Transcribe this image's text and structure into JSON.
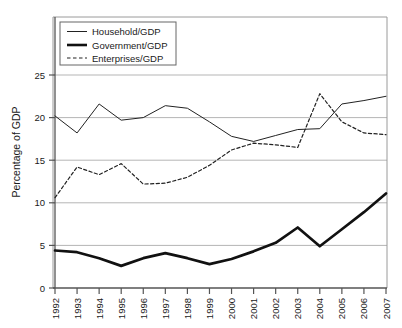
{
  "chart_data": {
    "type": "line",
    "title": "",
    "xlabel": "",
    "ylabel": "Percentage of GDP",
    "x": [
      "1992",
      "1993",
      "1994",
      "1995",
      "1996",
      "1997",
      "1998",
      "1999",
      "2000",
      "2001",
      "2002",
      "2003",
      "2004",
      "2005",
      "2006",
      "2007"
    ],
    "xtick_labels": [
      "1992",
      "1993",
      "1994",
      "1995",
      "1996",
      "1997",
      "1998",
      "1999",
      "2000",
      "2001",
      "2002",
      "2003",
      "2004",
      "2005",
      "2006",
      "2007"
    ],
    "ytick_labels": [
      "0",
      "5",
      "10",
      "15",
      "20",
      "25"
    ],
    "yticks": [
      0,
      5,
      10,
      15,
      20,
      25
    ],
    "ylim": [
      0,
      28.5
    ],
    "grid": "horizontal",
    "legend_position": "upper-left",
    "series": [
      {
        "name": "Household/GDP",
        "style": "solid-thin",
        "color": "#222222",
        "values": [
          20.2,
          18.2,
          21.6,
          19.7,
          20.0,
          21.4,
          21.1,
          19.5,
          17.8,
          17.2,
          17.9,
          18.6,
          18.7,
          21.6,
          22.0,
          22.5
        ]
      },
      {
        "name": "Government/GDP",
        "style": "solid-thick",
        "color": "#111111",
        "values": [
          4.4,
          4.2,
          3.5,
          2.6,
          3.5,
          4.1,
          3.5,
          2.8,
          3.4,
          4.3,
          5.3,
          7.1,
          4.9,
          6.9,
          8.9,
          11.1
        ]
      },
      {
        "name": "Enterprises/GDP",
        "style": "dashed",
        "color": "#222222",
        "values": [
          10.6,
          14.2,
          13.3,
          14.6,
          12.2,
          12.3,
          13.0,
          14.4,
          16.2,
          17.0,
          16.8,
          16.5,
          22.8,
          19.5,
          18.2,
          18.0
        ]
      }
    ]
  },
  "legend": {
    "items": [
      {
        "label": "Household/GDP"
      },
      {
        "label": "Government/GDP"
      },
      {
        "label": "Enterprises/GDP"
      }
    ]
  },
  "axes": {
    "y_title": "Percentage of GDP"
  },
  "colors": {
    "grid": "#b5b5b5",
    "axis": "#555555",
    "line": "#222222",
    "background": "#ffffff"
  }
}
